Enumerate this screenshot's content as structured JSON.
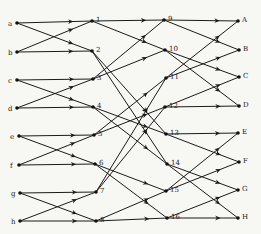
{
  "diagram": {
    "type": "fft-butterfly-network",
    "colors": {
      "line": "#1a1a1a",
      "node": "#111111",
      "background": "#f7f7f4"
    },
    "nodes": [
      {
        "id": "a",
        "label": "a",
        "x": 17,
        "y": 23,
        "side": "left"
      },
      {
        "id": "b",
        "label": "b",
        "x": 17,
        "y": 52,
        "side": "left"
      },
      {
        "id": "c",
        "label": "c",
        "x": 17,
        "y": 80,
        "side": "left"
      },
      {
        "id": "d",
        "label": "d",
        "x": 17,
        "y": 108,
        "side": "left"
      },
      {
        "id": "e",
        "label": "e",
        "x": 19,
        "y": 136,
        "side": "left"
      },
      {
        "id": "f",
        "label": "f",
        "x": 19,
        "y": 165,
        "side": "left"
      },
      {
        "id": "g",
        "label": "g",
        "x": 20,
        "y": 193,
        "side": "left"
      },
      {
        "id": "h",
        "label": "h",
        "x": 20,
        "y": 221,
        "side": "left"
      },
      {
        "id": "1",
        "label": "1",
        "x": 92,
        "y": 21,
        "side": "right"
      },
      {
        "id": "2",
        "label": "2",
        "x": 92,
        "y": 51,
        "side": "right"
      },
      {
        "id": "3",
        "label": "3",
        "x": 93,
        "y": 79,
        "side": "right"
      },
      {
        "id": "4",
        "label": "4",
        "x": 93,
        "y": 107,
        "side": "right"
      },
      {
        "id": "5",
        "label": "5",
        "x": 94,
        "y": 135,
        "side": "right"
      },
      {
        "id": "6",
        "label": "6",
        "x": 95,
        "y": 164,
        "side": "right"
      },
      {
        "id": "7",
        "label": "7",
        "x": 96,
        "y": 192,
        "side": "right"
      },
      {
        "id": "8",
        "label": "8",
        "x": 96,
        "y": 221,
        "side": "right"
      },
      {
        "id": "9",
        "label": "9",
        "x": 164,
        "y": 20,
        "side": "right"
      },
      {
        "id": "10",
        "label": "10",
        "x": 165,
        "y": 50,
        "side": "right"
      },
      {
        "id": "11",
        "label": "11",
        "x": 166,
        "y": 78,
        "side": "right"
      },
      {
        "id": "12",
        "label": "12",
        "x": 165,
        "y": 107,
        "side": "right"
      },
      {
        "id": "13",
        "label": "13",
        "x": 166,
        "y": 134,
        "side": "right"
      },
      {
        "id": "14",
        "label": "14",
        "x": 167,
        "y": 164,
        "side": "right"
      },
      {
        "id": "15",
        "label": "15",
        "x": 166,
        "y": 191,
        "side": "right"
      },
      {
        "id": "16",
        "label": "16",
        "x": 167,
        "y": 218,
        "side": "right"
      },
      {
        "id": "A",
        "label": "A",
        "x": 238,
        "y": 21,
        "side": "right"
      },
      {
        "id": "B",
        "label": "B",
        "x": 239,
        "y": 50,
        "side": "right"
      },
      {
        "id": "C",
        "label": "C",
        "x": 239,
        "y": 77,
        "side": "right"
      },
      {
        "id": "D",
        "label": "D",
        "x": 239,
        "y": 106,
        "side": "right"
      },
      {
        "id": "E",
        "label": "E",
        "x": 238,
        "y": 133,
        "side": "right"
      },
      {
        "id": "F",
        "label": "F",
        "x": 239,
        "y": 162,
        "side": "right"
      },
      {
        "id": "G",
        "label": "G",
        "x": 238,
        "y": 190,
        "side": "right"
      },
      {
        "id": "H",
        "label": "H",
        "x": 238,
        "y": 218,
        "side": "right"
      }
    ],
    "edges": [
      [
        "a",
        "1"
      ],
      [
        "a",
        "2"
      ],
      [
        "b",
        "1"
      ],
      [
        "b",
        "2"
      ],
      [
        "c",
        "3"
      ],
      [
        "c",
        "4"
      ],
      [
        "d",
        "3"
      ],
      [
        "d",
        "4"
      ],
      [
        "e",
        "5"
      ],
      [
        "e",
        "6"
      ],
      [
        "f",
        "5"
      ],
      [
        "f",
        "6"
      ],
      [
        "g",
        "7"
      ],
      [
        "g",
        "8"
      ],
      [
        "h",
        "7"
      ],
      [
        "h",
        "8"
      ],
      [
        "1",
        "9"
      ],
      [
        "1",
        "10"
      ],
      [
        "3",
        "9"
      ],
      [
        "3",
        "10"
      ],
      [
        "5",
        "11"
      ],
      [
        "5",
        "12"
      ],
      [
        "7",
        "11"
      ],
      [
        "7",
        "12"
      ],
      [
        "2",
        "13"
      ],
      [
        "2",
        "14"
      ],
      [
        "4",
        "13"
      ],
      [
        "4",
        "14"
      ],
      [
        "6",
        "15"
      ],
      [
        "6",
        "16"
      ],
      [
        "8",
        "15"
      ],
      [
        "8",
        "16"
      ],
      [
        "9",
        "A"
      ],
      [
        "9",
        "B"
      ],
      [
        "11",
        "A"
      ],
      [
        "11",
        "B"
      ],
      [
        "10",
        "C"
      ],
      [
        "10",
        "D"
      ],
      [
        "12",
        "C"
      ],
      [
        "12",
        "D"
      ],
      [
        "13",
        "E"
      ],
      [
        "13",
        "F"
      ],
      [
        "15",
        "E"
      ],
      [
        "15",
        "F"
      ],
      [
        "14",
        "G"
      ],
      [
        "14",
        "H"
      ],
      [
        "16",
        "G"
      ],
      [
        "16",
        "H"
      ]
    ]
  }
}
